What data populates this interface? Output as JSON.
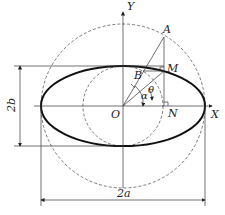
{
  "diagram": {
    "labels": {
      "y_axis": "Y",
      "x_axis": "X",
      "origin": "O",
      "point_a": "A",
      "point_b": "B",
      "point_m": "M",
      "point_n": "N",
      "angle_alpha": "α",
      "angle_theta": "θ",
      "minor_axis_dim": "2b",
      "major_axis_dim": "2a"
    },
    "elements": {
      "ellipse": "solid thick ellipse with semi-axes a and b",
      "outer_circle": "dashed circle of radius a",
      "inner_circle": "dashed circle of radius b"
    },
    "colors": {
      "stroke": "#111111",
      "background": "#ffffff"
    }
  }
}
